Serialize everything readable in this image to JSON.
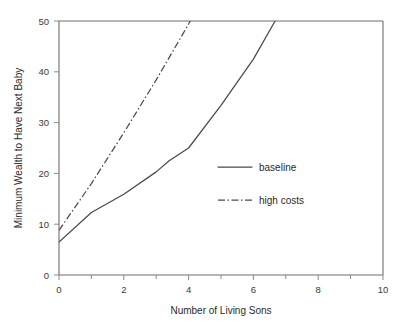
{
  "chart_data": {
    "type": "line",
    "title": "",
    "xlabel": "Number of Living Sons",
    "ylabel": "Minimum Wealth to Have Next Baby",
    "xlim": [
      0,
      10
    ],
    "ylim": [
      0,
      50
    ],
    "xticks": [
      0,
      2,
      4,
      6,
      8,
      10
    ],
    "xtick_labels": [
      "0",
      "2",
      "4",
      "6",
      "8",
      "10"
    ],
    "xminorticks": [
      1,
      3,
      5,
      7,
      9
    ],
    "yticks": [
      0,
      10,
      20,
      30,
      40,
      50
    ],
    "ytick_labels": [
      "0",
      "10",
      "20",
      "30",
      "40",
      "50"
    ],
    "grid": false,
    "legend_position": "center-right",
    "series": [
      {
        "name": "baseline",
        "style": "solid",
        "color": "#4a4a4a",
        "x": [
          0,
          1,
          2,
          3,
          3.4,
          4,
          5,
          6,
          6.67
        ],
        "y": [
          6.5,
          12.3,
          15.9,
          20.3,
          22.5,
          25.0,
          33.4,
          42.5,
          50.0
        ]
      },
      {
        "name": "high costs",
        "style": "dash-dot",
        "color": "#4a4a4a",
        "x": [
          0,
          1,
          2,
          3,
          4,
          4.05
        ],
        "y": [
          8.8,
          18.0,
          28.0,
          38.4,
          49.4,
          50.0
        ]
      }
    ],
    "legend": [
      {
        "label": "baseline",
        "style": "solid"
      },
      {
        "label": "high costs",
        "style": "dash-dot"
      }
    ]
  },
  "axes": {
    "x_axis_title": "Number of Living Sons",
    "y_axis_title": "Minimum Wealth to Have Next Baby",
    "x_tick_0": "0",
    "x_tick_1": "2",
    "x_tick_2": "4",
    "x_tick_3": "6",
    "x_tick_4": "8",
    "x_tick_5": "10",
    "y_tick_0": "0",
    "y_tick_1": "10",
    "y_tick_2": "20",
    "y_tick_3": "30",
    "y_tick_4": "40",
    "y_tick_5": "50"
  },
  "legend": {
    "baseline_label": "baseline",
    "high_costs_label": "high costs"
  },
  "colors": {
    "line": "#4a4a4a",
    "axis": "#6e6e6e",
    "text": "#2b2b2b",
    "background": "#ffffff"
  }
}
